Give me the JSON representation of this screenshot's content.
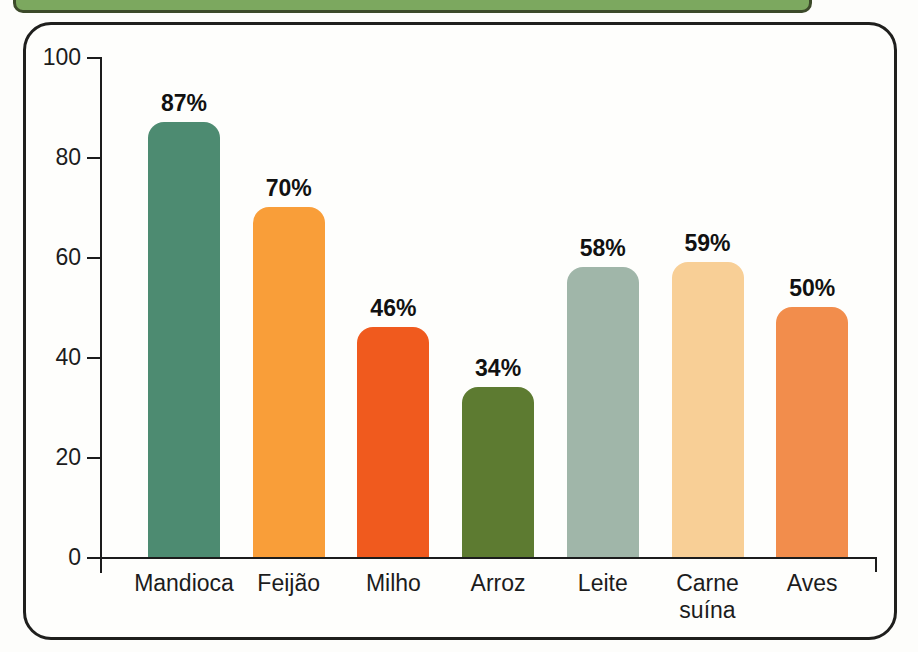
{
  "banner": {
    "fill_color": "#7ca85f",
    "border_color": "#3c4a2a"
  },
  "frame": {
    "border_color": "#1f1f1d",
    "background_color": "#fefefc"
  },
  "chart_data": {
    "type": "bar",
    "title": "",
    "xlabel": "",
    "ylabel": "",
    "categories": [
      "Mandioca",
      "Feijão",
      "Milho",
      "Arroz",
      "Leite",
      "Carne suína",
      "Aves"
    ],
    "values": [
      87,
      70,
      46,
      34,
      58,
      59,
      50
    ],
    "value_labels": [
      "87%",
      "70%",
      "46%",
      "34%",
      "58%",
      "59%",
      "50%"
    ],
    "bar_colors": [
      "#4d8b71",
      "#f99e39",
      "#f05a1e",
      "#5d7b31",
      "#a0b6a9",
      "#f8cf96",
      "#f28d4c"
    ],
    "ylim": [
      0,
      100
    ],
    "yticks": [
      0,
      20,
      40,
      60,
      80,
      100
    ],
    "grid": false,
    "legend": null,
    "axis_color": "#1c1c1c",
    "label_color": "#1c1c1c"
  }
}
